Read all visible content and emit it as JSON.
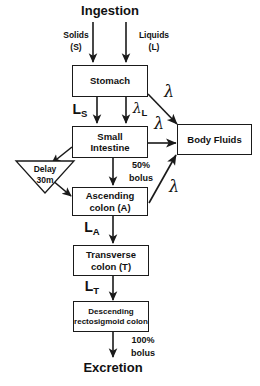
{
  "diagram": {
    "background_color": "#ffffff",
    "stroke_color": "#1a1a1a",
    "text_color": "#111111",
    "input_label": "Ingestion",
    "output_label": "Excretion",
    "inputs": [
      {
        "name": "Solids",
        "symbol": "(S)"
      },
      {
        "name": "Liquids",
        "symbol": "(L)"
      }
    ],
    "nodes": {
      "stomach": {
        "label": "Stomach"
      },
      "small_intestine": {
        "line1": "Small",
        "line2": "Intestine"
      },
      "body_fluids": {
        "label": "Body Fluids"
      },
      "delay": {
        "line1": "Delay",
        "line2": "30m"
      },
      "ascending_colon": {
        "line1": "Ascending",
        "line2": "colon (A)"
      },
      "transverse_colon": {
        "line1": "Transverse",
        "line2": "colon (T)"
      },
      "descending_colon": {
        "line1": "Descending",
        "line2": "rectosigmoid colon"
      }
    },
    "rate_labels": {
      "ls_base": "L",
      "ls_sub": "S",
      "lambda_l_base": "λ",
      "lambda_l_sub": "L",
      "la_base": "L",
      "la_sub": "A",
      "lt_base": "L",
      "lt_sub": "T",
      "lambda_stomach": "λ",
      "lambda_small_intestine": "λ",
      "lambda_ascending": "λ"
    },
    "flow_labels": {
      "bolus_50_pct": "50%",
      "bolus_50_word": "bolus",
      "bolus_100_pct": "100%",
      "bolus_100_word": "bolus"
    }
  }
}
